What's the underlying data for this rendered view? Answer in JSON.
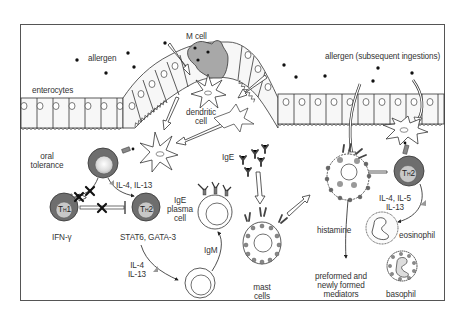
{
  "diagram": {
    "type": "immunology pathway illustration",
    "colors": {
      "frame": "#555555",
      "line": "#222222",
      "cell_fill": "#f7f7f7",
      "dark_cell": "#6e6e6e",
      "mid_gray": "#9a9a9a",
      "m_cell": "#a8a8a8",
      "granule": "#888888",
      "background": "#ffffff"
    },
    "labels": {
      "allergen": "allergen",
      "allergen_subsequent": "allergen (subsequent ingestions)",
      "m_cell": "M cell",
      "enterocytes": "enterocytes",
      "dendritic_cell_1": "dendritic",
      "dendritic_cell_2": "cell",
      "oral_tolerance_1": "oral",
      "oral_tolerance_2": "tolerance",
      "il4_il13_top": "IL-4, IL-13",
      "th1_main": "T",
      "th1_sub": "H",
      "th1_num": "1",
      "th2_main": "T",
      "th2_sub": "H",
      "th2_num": "2",
      "ifn_gamma": "IFN-γ",
      "stat6_gata3": "STAT6, GATA-3",
      "ige_plasma_1": "IgE",
      "ige_plasma_2": "plasma",
      "ige_plasma_3": "cell",
      "igm": "IgM",
      "il4_lower_1": "IL-4",
      "il4_lower_2": "IL-13",
      "ige": "IgE",
      "mast_1": "mast",
      "mast_2": "cells",
      "histamine": "histamine",
      "mediators_1": "preformed and",
      "mediators_2": "newly formed",
      "mediators_3": "mediators",
      "il4_il5_1": "IL-4, IL-5",
      "il4_il5_2": "IL-13",
      "eosinophil": "eosinophil",
      "basophil": "basophil"
    },
    "nodes": [
      "allergen",
      "M cell",
      "enterocytes",
      "dendritic cell",
      "naive T cell",
      "TH1",
      "TH2",
      "IgE plasma cell",
      "B cell (IgM)",
      "IgE",
      "mast cells",
      "degranulating mast cell",
      "TH2 (memory)",
      "eosinophil",
      "basophil"
    ],
    "edges": [
      {
        "from": "allergen",
        "to": "M cell"
      },
      {
        "from": "M cell",
        "to": "dendritic cell"
      },
      {
        "from": "dendritic cell",
        "to": "naive T cell"
      },
      {
        "from": "naive T cell",
        "to": "oral tolerance",
        "blocked": true
      },
      {
        "from": "naive T cell",
        "to": "TH1",
        "blocked": true
      },
      {
        "from": "naive T cell",
        "to": "TH2",
        "label": "IL-4, IL-13"
      },
      {
        "from": "TH1",
        "to": "TH2",
        "type": "inhibition",
        "blocked": true
      },
      {
        "from": "TH2",
        "to": "B cell",
        "label": "IL-4 IL-13"
      },
      {
        "from": "B cell",
        "to": "IgE plasma cell",
        "label": "IgM"
      },
      {
        "from": "IgE",
        "to": "mast cells"
      },
      {
        "from": "mast cells",
        "to": "degranulating mast cell"
      },
      {
        "from": "degranulating mast cell",
        "to": "mediators",
        "label": "histamine"
      },
      {
        "from": "TH2 (memory)",
        "to": "degranulating mast cell"
      },
      {
        "from": "TH2 (memory)",
        "to": "eosinophil",
        "label": "IL-4, IL-5 IL-13"
      }
    ]
  }
}
